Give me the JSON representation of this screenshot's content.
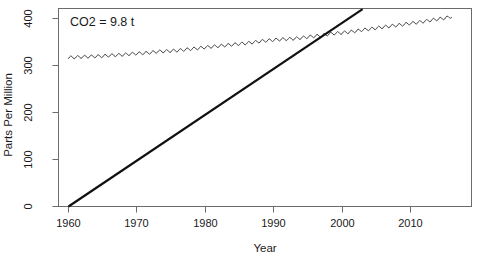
{
  "chart_data": {
    "type": "line",
    "title": "",
    "xlabel": "Year",
    "ylabel": "Parts Per Million",
    "xlim": [
      1958,
      2017
    ],
    "ylim": [
      -10,
      430
    ],
    "grid": false,
    "legend": null,
    "annotations": [
      {
        "name": "co2-annotation",
        "text": "CO2 = 9.8 t",
        "x": 1961.5,
        "y": 405
      }
    ],
    "xticks": [
      1960,
      1970,
      1980,
      1990,
      2000,
      2010
    ],
    "xtick_labels": [
      "1960",
      "1970",
      "1980",
      "1990",
      "2000",
      "2010"
    ],
    "yticks": [
      0,
      100,
      200,
      300,
      400
    ],
    "ytick_labels": [
      "0",
      "100",
      "200",
      "300",
      "400"
    ],
    "series": [
      {
        "name": "Atmospheric CO2 concentration",
        "style": "sawtooth-line",
        "color": "#444444",
        "linewidth": 1,
        "x": [
          1960,
          1961,
          1962,
          1963,
          1964,
          1965,
          1966,
          1967,
          1968,
          1969,
          1970,
          1971,
          1972,
          1973,
          1974,
          1975,
          1976,
          1977,
          1978,
          1979,
          1980,
          1981,
          1982,
          1983,
          1984,
          1985,
          1986,
          1987,
          1988,
          1989,
          1990,
          1991,
          1992,
          1993,
          1994,
          1995,
          1996,
          1997,
          1998,
          1999,
          2000,
          2001,
          2002,
          2003,
          2004,
          2005,
          2006,
          2007,
          2008,
          2009,
          2010,
          2011,
          2012,
          2013,
          2014,
          2015,
          2016
        ],
        "values": [
          316.9,
          317.6,
          318.5,
          319.0,
          319.6,
          320.0,
          321.4,
          322.2,
          323.0,
          324.6,
          325.7,
          326.3,
          327.5,
          329.7,
          330.2,
          331.1,
          332.0,
          333.8,
          335.4,
          336.8,
          338.8,
          340.1,
          341.4,
          343.0,
          344.6,
          346.0,
          347.4,
          349.2,
          351.6,
          353.1,
          354.4,
          355.6,
          356.4,
          357.1,
          358.8,
          360.8,
          362.6,
          363.7,
          366.7,
          368.4,
          369.6,
          371.2,
          373.2,
          375.8,
          377.5,
          379.8,
          381.9,
          383.8,
          385.6,
          387.4,
          389.9,
          391.6,
          393.8,
          396.5,
          398.6,
          400.8,
          404.2
        ],
        "seasonal_amplitude_ppm": 3.2
      },
      {
        "name": "Cumulative emissions trend",
        "style": "straight-line",
        "color": "#111111",
        "linewidth": 2.2,
        "x": [
          1960,
          2003
        ],
        "values": [
          0,
          420
        ]
      }
    ]
  },
  "axes": {
    "ylabel_text": "Parts Per Million",
    "xlabel_text": "Year"
  },
  "colors": {
    "background": "#ffffff",
    "axis": "#6b6b6b",
    "text": "#1a1a1a",
    "co2_line": "#444444",
    "trend_line": "#111111"
  }
}
